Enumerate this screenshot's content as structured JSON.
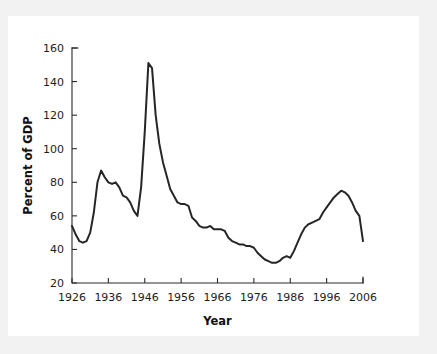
{
  "figure": {
    "background_color": "#ffffff",
    "frame_color": "#f2f2f2",
    "line_color": "#262626",
    "axis_color": "#2b2b2b"
  },
  "chart_data": {
    "type": "line",
    "title": "",
    "xlabel": "Year",
    "ylabel": "Percent of GDP",
    "xlim": [
      1926,
      2006
    ],
    "ylim": [
      20,
      160
    ],
    "xticks": [
      1926,
      1936,
      1946,
      1956,
      1966,
      1976,
      1986,
      1996,
      2006
    ],
    "yticks": [
      20,
      40,
      60,
      80,
      100,
      120,
      140,
      160
    ],
    "xtick_labels": [
      "1926",
      "1936",
      "1946",
      "1956",
      "1966",
      "1976",
      "1986",
      "1996",
      "2006"
    ],
    "ytick_labels": [
      "20",
      "40",
      "60",
      "80",
      "100",
      "120",
      "140",
      "160"
    ],
    "grid": false,
    "legend": null,
    "series": [
      {
        "name": "Percent of GDP",
        "color": "#262626",
        "x": [
          1926,
          1927,
          1928,
          1929,
          1930,
          1931,
          1932,
          1933,
          1934,
          1935,
          1936,
          1937,
          1938,
          1939,
          1940,
          1941,
          1942,
          1943,
          1944,
          1945,
          1946,
          1947,
          1948,
          1949,
          1950,
          1951,
          1952,
          1953,
          1954,
          1955,
          1956,
          1957,
          1958,
          1959,
          1960,
          1961,
          1962,
          1963,
          1964,
          1965,
          1966,
          1967,
          1968,
          1969,
          1970,
          1971,
          1972,
          1973,
          1974,
          1975,
          1976,
          1977,
          1978,
          1979,
          1980,
          1981,
          1982,
          1983,
          1984,
          1985,
          1986,
          1987,
          1988,
          1989,
          1990,
          1991,
          1992,
          1993,
          1994,
          1995,
          1996,
          1997,
          1998,
          1999,
          2000,
          2001,
          2002,
          2003,
          2004,
          2005,
          2006
        ],
        "y": [
          54,
          49,
          45,
          44,
          45,
          50,
          62,
          80,
          87,
          83,
          80,
          79,
          80,
          77,
          72,
          71,
          68,
          63,
          60,
          77,
          110,
          151,
          148,
          120,
          103,
          92,
          84,
          76,
          72,
          68,
          67,
          67,
          66,
          59,
          57,
          54,
          53,
          53,
          54,
          52,
          52,
          52,
          51,
          47,
          45,
          44,
          43,
          43,
          42,
          42,
          41,
          38,
          36,
          34,
          33,
          32,
          32,
          33,
          35,
          36,
          35,
          39,
          44,
          49,
          53,
          55,
          56,
          57,
          58,
          62,
          65,
          68,
          71,
          73,
          75,
          74,
          72,
          68,
          63,
          60,
          45
        ]
      }
    ],
    "annotations": [
      {
        "label": "peak",
        "x": 1947,
        "y": 151
      },
      {
        "label": "prewar_trough",
        "x": 1944,
        "y": 60
      },
      {
        "label": "modern_low",
        "x": 1981,
        "y": 32
      },
      {
        "label": "modern_peak",
        "x": 2000,
        "y": 75
      }
    ]
  }
}
